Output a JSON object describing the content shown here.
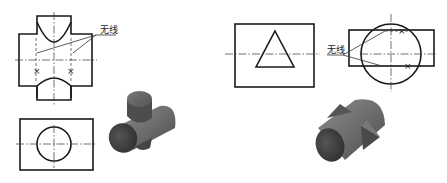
{
  "figure": {
    "left_example": {
      "front_view_label": "无线",
      "description": "Two perpendicular cylinders intersecting (cross-shaped pipe) — front view shows curved intersection lines, top view shows circle in rectangle",
      "marker_symbol": "×"
    },
    "right_example": {
      "side_view_label": "无线",
      "description": "Cylinder intersected by triangular prism — front view shows triangle in rectangle, side view shows circle over rectangle",
      "marker_symbol": "×"
    },
    "colors": {
      "line": "#1a1a1a",
      "model_dark": "#3a3a3a",
      "model_mid": "#6e6e6e",
      "model_light": "#8a8a8a",
      "background": "#ffffff"
    }
  }
}
